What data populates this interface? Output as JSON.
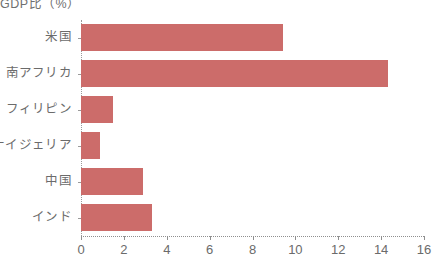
{
  "chart_data": {
    "type": "bar",
    "orientation": "horizontal",
    "title": "GDP比（%）",
    "xlabel": "",
    "ylabel": "",
    "categories": [
      "米国",
      "南アフリカ",
      "フィリピン",
      "ナイジェリア",
      "中国",
      "インド"
    ],
    "values": [
      9.4,
      14.3,
      1.5,
      0.9,
      2.9,
      3.3
    ],
    "xlim": [
      0,
      16
    ],
    "xticks": [
      0,
      2,
      4,
      6,
      8,
      10,
      12,
      14,
      16
    ],
    "xtick_labels": [
      "0",
      "2",
      "4",
      "6",
      "8",
      "10",
      "12",
      "14",
      "16"
    ],
    "grid": false,
    "legend": null,
    "bar_color": "#cc6c6a",
    "axis_color": "#8f8f8f",
    "text_color": "#6b6b6b"
  }
}
